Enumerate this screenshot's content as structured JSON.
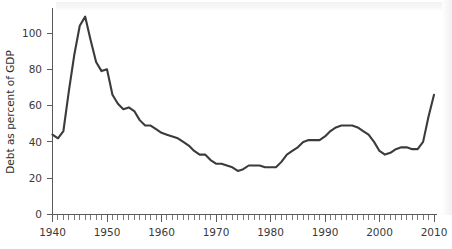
{
  "chart_data": {
    "type": "line",
    "title": "",
    "subtitle": "",
    "xlabel": "",
    "ylabel": "Debt as percent of GDP",
    "xlim": [
      1940,
      2010
    ],
    "ylim": [
      0,
      115
    ],
    "grid": false,
    "legend": null,
    "x_major_ticks": [
      1940,
      1950,
      1960,
      1970,
      1980,
      1990,
      2000,
      2010
    ],
    "x_major_tick_labels": [
      "1940",
      "1950",
      "1960",
      "1970",
      "1980",
      "1990",
      "2000",
      "2010"
    ],
    "x_minor_tick_interval": 1,
    "y_major_ticks": [
      0,
      20,
      40,
      60,
      80,
      100
    ],
    "y_major_tick_labels": [
      "0",
      "20",
      "40",
      "60",
      "80",
      "100"
    ],
    "line_color": "#3b3b3b",
    "background_color": "#ffffff",
    "axis_color": "#5a5a5a",
    "series": [
      {
        "name": "Debt as percent of GDP",
        "x": [
          1940,
          1941,
          1942,
          1943,
          1944,
          1945,
          1946,
          1947,
          1948,
          1949,
          1950,
          1951,
          1952,
          1953,
          1954,
          1955,
          1956,
          1957,
          1958,
          1959,
          1960,
          1961,
          1962,
          1963,
          1964,
          1965,
          1966,
          1967,
          1968,
          1969,
          1970,
          1971,
          1972,
          1973,
          1974,
          1975,
          1976,
          1977,
          1978,
          1979,
          1980,
          1981,
          1982,
          1983,
          1984,
          1985,
          1986,
          1987,
          1988,
          1989,
          1990,
          1991,
          1992,
          1993,
          1994,
          1995,
          1996,
          1997,
          1998,
          1999,
          2000,
          2001,
          2002,
          2003,
          2004,
          2005,
          2006,
          2007,
          2008,
          2009,
          2010
        ],
        "values": [
          44,
          42,
          46,
          68,
          88,
          104,
          109,
          96,
          84,
          79,
          80,
          66,
          61,
          58,
          59,
          57,
          52,
          49,
          49,
          47,
          45,
          44,
          43,
          42,
          40,
          38,
          35,
          33,
          33,
          30,
          28,
          28,
          27,
          26,
          24,
          25,
          27,
          27,
          27,
          26,
          26,
          26,
          29,
          33,
          35,
          37,
          40,
          41,
          41,
          41,
          43,
          46,
          48,
          49,
          49,
          49,
          48,
          46,
          44,
          40,
          35,
          33,
          34,
          36,
          37,
          37,
          36,
          36,
          40,
          54,
          66
        ]
      }
    ]
  },
  "axes": {
    "y_title": "Debt as percent of GDP"
  }
}
